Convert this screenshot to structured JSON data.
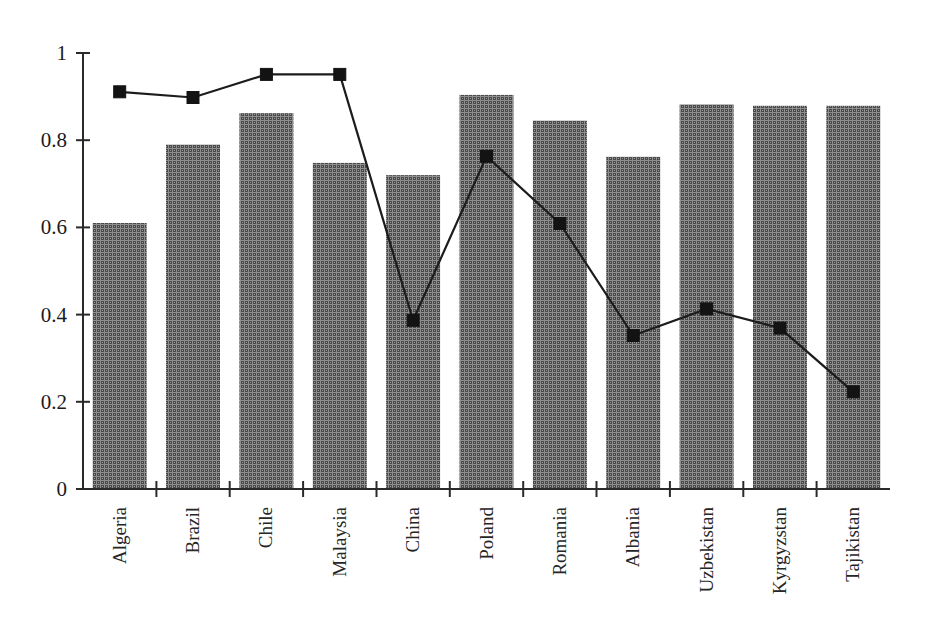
{
  "chart_data": {
    "type": "bar",
    "title": "",
    "subtitle": "",
    "xlabel": "",
    "ylabel": "",
    "ylim": [
      0,
      1
    ],
    "yticks": [
      0,
      0.2,
      0.4,
      0.6,
      0.8,
      1
    ],
    "ytick_labels": [
      "0",
      "0.2",
      "0.4",
      "0.6",
      "0.8",
      "1"
    ],
    "grid": false,
    "legend": null,
    "categories": [
      "Algeria",
      "Brazil",
      "Chile",
      "Malaysia",
      "China",
      "Poland",
      "Romania",
      "Albania",
      "Uzbekistan",
      "Kyrgyzstan",
      "Tajikistan"
    ],
    "series": [
      {
        "name": "bars",
        "render": "bar",
        "values": [
          0.61,
          0.79,
          0.862,
          0.748,
          0.72,
          0.904,
          0.845,
          0.762,
          0.882,
          0.879,
          0.879
        ]
      },
      {
        "name": "line",
        "render": "line-markers",
        "values": [
          0.911,
          0.898,
          0.951,
          0.951,
          0.387,
          0.763,
          0.609,
          0.352,
          0.413,
          0.369,
          0.223
        ]
      }
    ],
    "colors": {
      "bar_fill": "#4d4d4d",
      "bar_fill_light": "#8d8d8d",
      "line": "#1c1c1c",
      "marker": "#131313",
      "axis": "#2a2a2a",
      "background": "#ffffff"
    }
  },
  "axis": {
    "y_tick_labels": [
      "1",
      "0.8",
      "0.6",
      "0.4",
      "0.2",
      "0"
    ],
    "x_tick_labels": [
      "Algeria",
      "Brazil",
      "Chile",
      "Malaysia",
      "China",
      "Poland",
      "Romania",
      "Albania",
      "Uzbekistan",
      "Kyrgyzstan",
      "Tajikistan"
    ]
  }
}
